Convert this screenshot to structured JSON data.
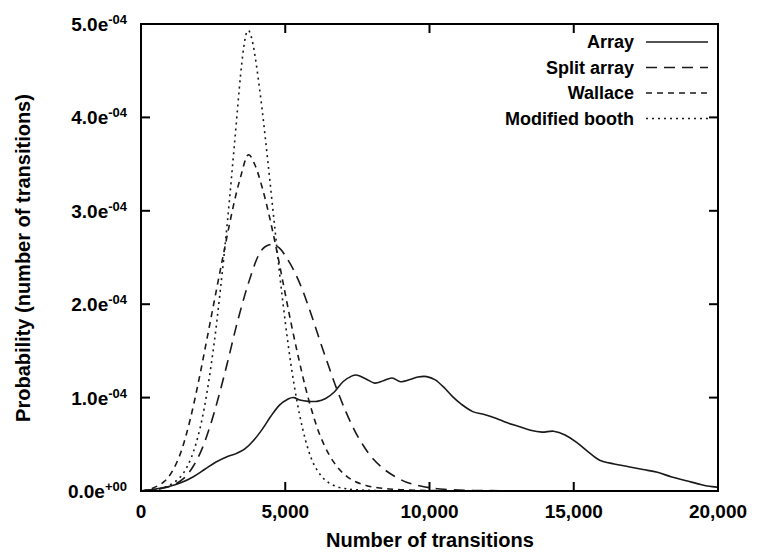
{
  "chart_data": {
    "type": "line",
    "title": "",
    "xlabel": "Number of transitions",
    "ylabel": "Probability (number of transitions)",
    "xlim": [
      0,
      20000
    ],
    "ylim": [
      0,
      0.0005
    ],
    "grid": false,
    "legend_position": "top-right",
    "xticks": [
      {
        "value": 0,
        "label": "0"
      },
      {
        "value": 5000,
        "label": "5,000"
      },
      {
        "value": 10000,
        "label": "10,000"
      },
      {
        "value": 15000,
        "label": "15,000"
      },
      {
        "value": 20000,
        "label": "20,000"
      }
    ],
    "yticks": [
      {
        "value": 0,
        "mantissa": "0.0e",
        "exponent": "+00"
      },
      {
        "value": 0.0001,
        "mantissa": "1.0e",
        "exponent": "-04"
      },
      {
        "value": 0.0002,
        "mantissa": "2.0e",
        "exponent": "-04"
      },
      {
        "value": 0.0003,
        "mantissa": "3.0e",
        "exponent": "-04"
      },
      {
        "value": 0.0004,
        "mantissa": "4.0e",
        "exponent": "-04"
      },
      {
        "value": 0.0005,
        "mantissa": "5.0e",
        "exponent": "-04"
      }
    ],
    "series": [
      {
        "name": "Array",
        "style": "solid",
        "dash": "",
        "peak_x": 7500,
        "peak_y": 0.000124,
        "x": [
          0,
          500,
          1000,
          1400,
          1800,
          2200,
          2600,
          3000,
          3300,
          3600,
          3900,
          4200,
          4500,
          4800,
          5100,
          5300,
          5500,
          5800,
          6100,
          6400,
          6700,
          7000,
          7300,
          7500,
          7800,
          8100,
          8400,
          8700,
          9000,
          9300,
          9600,
          9900,
          10200,
          10500,
          10800,
          11100,
          11500,
          11900,
          12300,
          12700,
          13100,
          13500,
          13900,
          14300,
          14700,
          15100,
          15500,
          15900,
          16400,
          16900,
          17400,
          17900,
          18400,
          18900,
          19400,
          19700,
          20000
        ],
        "y": [
          0.0,
          2e-06,
          5e-06,
          9e-06,
          1.5e-05,
          2.3e-05,
          3.1e-05,
          3.7e-05,
          4e-05,
          4.5e-05,
          5.4e-05,
          6.6e-05,
          8e-05,
          9.2e-05,
          9.85e-05,
          0.0001,
          9.75e-05,
          9.6e-05,
          9.6e-05,
          9.9e-05,
          0.000106,
          0.000117,
          0.000123,
          0.000124,
          0.00012,
          0.0001155,
          0.000118,
          0.000121,
          0.000117,
          0.000119,
          0.000122,
          0.0001225,
          0.000119,
          0.000111,
          0.000101,
          9.3e-05,
          8.5e-05,
          8.2e-05,
          7.8e-05,
          7.3e-05,
          6.9e-05,
          6.5e-05,
          6.3e-05,
          6.4e-05,
          6e-05,
          5.2e-05,
          4.2e-05,
          3.3e-05,
          2.9e-05,
          2.6e-05,
          2.3e-05,
          2e-05,
          1.5e-05,
          1.1e-05,
          7e-06,
          5e-06,
          4e-06
        ]
      },
      {
        "name": "Split array",
        "style": "dashed",
        "dash": "11 7",
        "peak_x": 4550,
        "peak_y": 0.000264,
        "x": [
          0,
          600,
          1100,
          1500,
          1800,
          2100,
          2400,
          2700,
          3000,
          3300,
          3600,
          3900,
          4100,
          4300,
          4550,
          4800,
          5000,
          5300,
          5600,
          5900,
          6200,
          6500,
          6800,
          7100,
          7400,
          7700,
          8000,
          8400,
          8800,
          9200,
          9600,
          10000,
          10500,
          11000,
          11500,
          12000,
          13000,
          14000,
          16000,
          18000,
          20000
        ],
        "y": [
          0.0,
          2e-06,
          6e-06,
          1.4e-05,
          2.6e-05,
          4.4e-05,
          7e-05,
          0.000102,
          0.000138,
          0.000176,
          0.00021,
          0.000239,
          0.000254,
          0.0002615,
          0.000264,
          0.00026,
          0.000252,
          0.000236,
          0.000215,
          0.000189,
          0.000161,
          0.000134,
          0.000108,
          8.5e-05,
          6.5e-05,
          4.9e-05,
          3.6e-05,
          2.4e-05,
          1.55e-05,
          9.5e-06,
          6e-06,
          3.5e-06,
          1.8e-06,
          1e-06,
          6e-07,
          4e-07,
          2e-07,
          1e-07,
          0.0,
          0.0,
          0.0
        ]
      },
      {
        "name": "Wallace",
        "style": "short-dashed",
        "dash": "6 5",
        "peak_x": 3700,
        "peak_y": 0.00036,
        "x": [
          0,
          400,
          800,
          1100,
          1400,
          1700,
          2000,
          2300,
          2600,
          2900,
          3200,
          3450,
          3700,
          3950,
          4200,
          4450,
          4700,
          4950,
          5200,
          5450,
          5700,
          5950,
          6200,
          6500,
          6800,
          7100,
          7400,
          7800,
          8200,
          8600,
          9000,
          9500,
          10000,
          10600,
          11200,
          12000,
          13000,
          14500,
          16000,
          18000,
          20000
        ],
        "y": [
          0.0,
          3e-06,
          1e-05,
          2.2e-05,
          4.3e-05,
          7.6e-05,
          0.000118,
          0.000165,
          0.000213,
          0.00026,
          0.000305,
          0.000336,
          0.0003595,
          0.000349,
          0.000325,
          0.000294,
          0.000258,
          0.000219,
          0.00018,
          0.000144,
          0.000111,
          8.3e-05,
          6e-05,
          4e-05,
          2.6e-05,
          1.65e-05,
          1.05e-05,
          6e-06,
          3.5e-06,
          2.2e-06,
          1.4e-06,
          8e-07,
          5e-07,
          3e-07,
          2e-07,
          1e-07,
          0.0,
          0.0,
          0.0,
          0.0,
          0.0
        ]
      },
      {
        "name": "Modified booth",
        "style": "dotted",
        "dash": "2 4",
        "peak_x": 3720,
        "peak_y": 0.000493,
        "x": [
          0,
          500,
          900,
          1300,
          1600,
          1900,
          2200,
          2500,
          2750,
          3000,
          3250,
          3450,
          3600,
          3720,
          3850,
          4000,
          4200,
          4400,
          4600,
          4800,
          5000,
          5200,
          5400,
          5600,
          5800,
          6000,
          6250,
          6500,
          6800,
          7100,
          7400,
          7800,
          8200,
          8700,
          9200,
          10000,
          11000,
          12500,
          14500,
          17000,
          20000
        ],
        "y": [
          0.0,
          1.5e-06,
          5e-06,
          1.3e-05,
          2.6e-05,
          5e-05,
          9e-05,
          0.00015,
          0.000215,
          0.00029,
          0.000375,
          0.000445,
          0.000483,
          0.000493,
          0.000483,
          0.000456,
          0.000408,
          0.000352,
          0.000293,
          0.000234,
          0.000181,
          0.000135,
          9.7e-05,
          6.7e-05,
          4.4e-05,
          2.8e-05,
          1.6e-05,
          9e-06,
          4.5e-06,
          2.5e-06,
          1.4e-06,
          8e-07,
          4e-07,
          2e-07,
          1e-07,
          1e-07,
          0.0,
          0.0,
          0.0,
          0.0,
          0.0
        ]
      }
    ]
  }
}
